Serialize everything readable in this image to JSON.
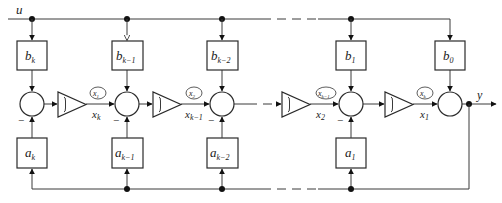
{
  "diagram": {
    "type": "block-diagram",
    "input_label": "u",
    "output_label": "y",
    "minus_sign": "−",
    "stages": [
      {
        "b": "b",
        "b_sub": "k",
        "a": "a",
        "a_sub": "k"
      },
      {
        "b": "b",
        "b_sub": "k−1",
        "a": "a",
        "a_sub": "k−1"
      },
      {
        "b": "b",
        "b_sub": "k−2",
        "a": "a",
        "a_sub": "k−2"
      },
      {
        "b": "b",
        "b_sub": "1",
        "a": "a",
        "a_sub": "1"
      },
      {
        "b": "b",
        "b_sub": "0"
      }
    ],
    "integrators": [
      {
        "state_tag": "x",
        "state_tag_sub": "1",
        "signal": "x",
        "signal_sub": "k"
      },
      {
        "state_tag": "x",
        "state_tag_sub": "2",
        "signal": "x",
        "signal_sub": "k−1"
      },
      {
        "state_tag": "x",
        "state_tag_sub": "k−1",
        "signal": "x",
        "signal_sub": "2"
      },
      {
        "state_tag": "x",
        "state_tag_sub": "k",
        "signal": "x",
        "signal_sub": "1"
      }
    ],
    "colors": {
      "line": "#3a3a3a",
      "fill": "#ffffff",
      "dot": "#111111"
    }
  }
}
